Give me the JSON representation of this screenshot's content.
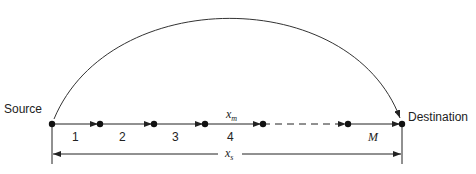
{
  "diagram": {
    "endpoints": {
      "source": "Source",
      "destination": "Destination"
    },
    "hop_labels": [
      "1",
      "2",
      "3",
      "4",
      "M"
    ],
    "distance_labels": {
      "hop": "x",
      "hop_sub": "m",
      "total": "x",
      "total_sub": "s"
    },
    "colors": {
      "line": "#222222",
      "node": "#111111",
      "background": "#ffffff"
    }
  }
}
